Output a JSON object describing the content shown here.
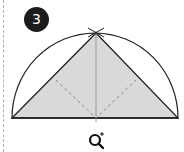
{
  "step": {
    "number": "3"
  },
  "diagram": {
    "colors": {
      "fill": "#d9d9d9",
      "stroke": "#222222",
      "dashed": "#888888",
      "badge": "#1c1c1c"
    }
  },
  "controls": {
    "zoom_icon": "zoom-in-icon"
  }
}
